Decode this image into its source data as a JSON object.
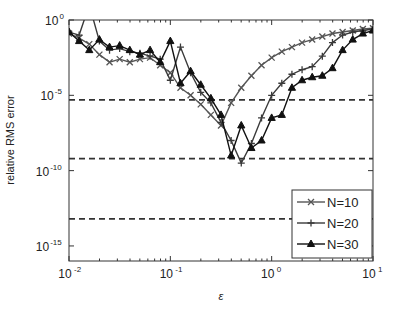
{
  "chart_data": {
    "type": "line",
    "title": "",
    "xlabel": "ε",
    "ylabel": "relative RMS error",
    "xscale": "log",
    "yscale": "log",
    "xlim": [
      0.01,
      10
    ],
    "ylim": [
      1e-16,
      1
    ],
    "xticks": [
      {
        "value": -2,
        "label": "10",
        "exp": "-2"
      },
      {
        "value": -1,
        "label": "10",
        "exp": "-1"
      },
      {
        "value": 0,
        "label": "10",
        "exp": "0"
      },
      {
        "value": 1,
        "label": "10",
        "exp": "1"
      }
    ],
    "yticks": [
      {
        "value": 0,
        "label": "10",
        "exp": "0"
      },
      {
        "value": -5,
        "label": "10",
        "exp": "-5"
      },
      {
        "value": -10,
        "label": "10",
        "exp": "-10"
      },
      {
        "value": -15,
        "label": "10",
        "exp": "-15"
      }
    ],
    "grid": false,
    "legend_position": "lower right",
    "reference_lines_log10": [
      -5.3,
      -9.2,
      -13.2
    ],
    "note": "x and y values below are log10 of epsilon and log10 of relative RMS error",
    "series": [
      {
        "name": "N=10",
        "marker": "x",
        "log10_x": [
          -2.0,
          -1.9,
          -1.8,
          -1.7,
          -1.6,
          -1.5,
          -1.4,
          -1.3,
          -1.2,
          -1.1,
          -1.0,
          -0.9,
          -0.8,
          -0.7,
          -0.6,
          -0.5,
          -0.4,
          -0.3,
          -0.2,
          -0.1,
          0.0,
          0.1,
          0.2,
          0.3,
          0.4,
          0.5,
          0.6,
          0.7,
          0.8,
          0.9,
          1.0
        ],
        "log10_y": [
          -0.9,
          -1.2,
          -1.6,
          -2.3,
          -2.8,
          -2.6,
          -2.8,
          -2.6,
          -2.5,
          -3.0,
          -3.5,
          -4.5,
          -5.0,
          -5.6,
          -6.3,
          -7.0,
          -5.5,
          -4.5,
          -3.7,
          -3.0,
          -2.5,
          -2.1,
          -1.8,
          -1.5,
          -1.3,
          -1.1,
          -0.9,
          -0.8,
          -0.7,
          -0.6,
          -0.55
        ]
      },
      {
        "name": "N=20",
        "marker": "+",
        "log10_x": [
          -2.0,
          -1.9,
          -1.8,
          -1.7,
          -1.6,
          -1.5,
          -1.4,
          -1.3,
          -1.2,
          -1.1,
          -1.0,
          -0.9,
          -0.8,
          -0.7,
          -0.6,
          -0.5,
          -0.4,
          -0.3,
          -0.2,
          -0.1,
          0.0,
          0.1,
          0.2,
          0.3,
          0.4,
          0.5,
          0.6,
          0.7,
          0.8,
          0.9,
          1.0
        ],
        "log10_y": [
          -0.8,
          -1.0,
          1.0,
          -1.4,
          -2.0,
          -1.9,
          -2.1,
          -2.2,
          -2.4,
          -2.6,
          -4.0,
          -1.8,
          -3.5,
          -4.8,
          -5.5,
          -6.8,
          -8.0,
          -9.5,
          -8.2,
          -6.5,
          -5.0,
          -4.2,
          -3.6,
          -3.3,
          -3.1,
          -2.4,
          -1.5,
          -1.0,
          -0.8,
          -0.7,
          -0.6
        ]
      },
      {
        "name": "N=30",
        "marker": "triangle",
        "log10_x": [
          -2.0,
          -1.9,
          -1.8,
          -1.7,
          -1.6,
          -1.5,
          -1.4,
          -1.3,
          -1.2,
          -1.1,
          -1.0,
          -0.9,
          -0.8,
          -0.7,
          -0.6,
          -0.5,
          -0.4,
          -0.3,
          -0.2,
          -0.1,
          0.0,
          0.1,
          0.2,
          0.3,
          0.4,
          0.5,
          0.6,
          0.7,
          0.8,
          0.9,
          1.0
        ],
        "log10_y": [
          -0.8,
          -1.4,
          -2.0,
          -1.3,
          -1.8,
          -1.7,
          -2.0,
          -2.3,
          -2.0,
          -2.8,
          -1.4,
          -4.2,
          -3.4,
          -4.3,
          -5.2,
          -6.3,
          -9.0,
          -7.0,
          -8.5,
          -8.0,
          -6.5,
          -6.3,
          -4.5,
          -4.0,
          -3.8,
          -3.7,
          -3.2,
          -2.0,
          -1.3,
          -0.9,
          -0.7
        ]
      }
    ]
  }
}
